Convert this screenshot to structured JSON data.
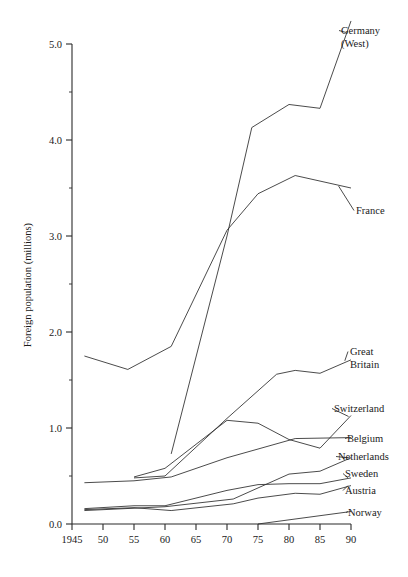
{
  "chart_data": {
    "type": "line",
    "title": "",
    "xlabel": "",
    "ylabel": "Foreign population (millions)",
    "xlim": [
      1945,
      1990
    ],
    "ylim": [
      0.0,
      5.0
    ],
    "grid": false,
    "legend_position": "right-inline-labels",
    "x_tick_labels": [
      "1945",
      "50",
      "55",
      "60",
      "65",
      "70",
      "75",
      "80",
      "85",
      "90"
    ],
    "x_tick_values": [
      1945,
      1950,
      1955,
      1960,
      1965,
      1970,
      1975,
      1980,
      1985,
      1990
    ],
    "y_tick_labels": [
      "0.0",
      "1.0",
      "2.0",
      "3.0",
      "4.0",
      "5.0"
    ],
    "y_tick_values": [
      0.0,
      1.0,
      2.0,
      3.0,
      4.0,
      5.0
    ],
    "y_minor_tick_values": [
      0.5,
      1.5,
      2.5,
      3.5,
      4.5
    ],
    "series": [
      {
        "name": "Germany (West)",
        "label": "Germany",
        "label_line2": "(West)",
        "x": [
          1961,
          1970,
          1974,
          1980,
          1985,
          1990
        ],
        "values": [
          0.73,
          3.0,
          4.13,
          4.37,
          4.33,
          5.24
        ]
      },
      {
        "name": "France",
        "label": "France",
        "label_line2": "",
        "x": [
          1947,
          1954,
          1961,
          1970,
          1975,
          1981,
          1990
        ],
        "values": [
          1.75,
          1.61,
          1.85,
          3.06,
          3.44,
          3.63,
          3.5
        ]
      },
      {
        "name": "Great Britain",
        "label": "Great",
        "label_line2": "Britain",
        "x": [
          1955,
          1960,
          1970,
          1978,
          1981,
          1985,
          1990
        ],
        "values": [
          0.48,
          0.5,
          1.1,
          1.56,
          1.6,
          1.57,
          1.71
        ]
      },
      {
        "name": "Switzerland",
        "label": "Switzerland",
        "label_line2": "",
        "x": [
          1955,
          1960,
          1970,
          1975,
          1980,
          1985,
          1990
        ],
        "values": [
          0.49,
          0.58,
          1.08,
          1.05,
          0.88,
          0.79,
          1.13
        ]
      },
      {
        "name": "Belgium",
        "label": "Belgium",
        "label_line2": "",
        "x": [
          1947,
          1955,
          1961,
          1970,
          1981,
          1990
        ],
        "values": [
          0.43,
          0.45,
          0.49,
          0.69,
          0.89,
          0.9
        ]
      },
      {
        "name": "Netherlands",
        "label": "Netherlands",
        "label_line2": "",
        "x": [
          1947,
          1960,
          1971,
          1980,
          1985,
          1990
        ],
        "values": [
          0.14,
          0.18,
          0.26,
          0.52,
          0.55,
          0.69
        ]
      },
      {
        "name": "Sweden",
        "label": "Sweden",
        "label_line2": "",
        "x": [
          1947,
          1955,
          1960,
          1970,
          1975,
          1980,
          1985,
          1990
        ],
        "values": [
          0.16,
          0.19,
          0.19,
          0.35,
          0.41,
          0.42,
          0.42,
          0.48
        ]
      },
      {
        "name": "Austria",
        "label": "Austria",
        "label_line2": "",
        "x": [
          1947,
          1955,
          1961,
          1971,
          1975,
          1981,
          1985,
          1990
        ],
        "values": [
          0.15,
          0.17,
          0.14,
          0.21,
          0.27,
          0.32,
          0.31,
          0.4
        ]
      },
      {
        "name": "Norway",
        "label": "Norway",
        "label_line2": "",
        "x": [
          1975,
          1990
        ],
        "values": [
          0.0,
          0.13
        ]
      }
    ]
  },
  "labels": {
    "germany_l1": "Germany",
    "germany_l2": "(West)",
    "france": "France",
    "gb_l1": "Great",
    "gb_l2": "Britain",
    "switzerland": "Switzerland",
    "belgium": "Belgium",
    "netherlands": "Netherlands",
    "sweden": "Sweden",
    "austria": "Austria",
    "norway": "Norway"
  },
  "axis": {
    "y_title": "Foreign population (millions)",
    "y_ticks": [
      "5.0",
      "4.0",
      "3.0",
      "2.0",
      "1.0",
      "0.0"
    ],
    "x_ticks": [
      "1945",
      "50",
      "55",
      "60",
      "65",
      "70",
      "75",
      "80",
      "85",
      "90"
    ]
  },
  "colors": {
    "line": "#2b2b2b",
    "text": "#1a1a1a",
    "background": "#ffffff"
  }
}
